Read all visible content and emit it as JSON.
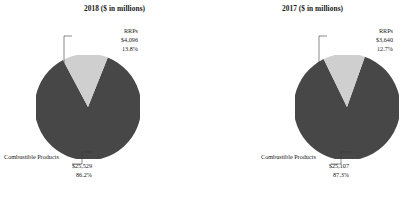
{
  "chart_data": [
    {
      "type": "pie",
      "title": "2018 ($ in millions)",
      "categories": [
        "RRPs",
        "Combustible Products"
      ],
      "values": [
        4096,
        25529
      ],
      "percentages": [
        13.8,
        87.3
      ],
      "labels": [
        {
          "name": "RRPs",
          "value": "$4,096",
          "percent": "13.8%"
        },
        {
          "name": "Combustible Products",
          "value": "$25,529",
          "percent": "86.2%"
        }
      ],
      "colors": [
        "#cfcfcf",
        "#474747"
      ],
      "legend": "none",
      "grid": false,
      "start_angle_deg": -28
    },
    {
      "type": "pie",
      "title": "2017 ($ in millions)",
      "categories": [
        "RRPs",
        "Combustible Products"
      ],
      "values": [
        3640,
        25107
      ],
      "percentages": [
        12.7,
        87.3
      ],
      "labels": [
        {
          "name": "RRPs",
          "value": "$3,640",
          "percent": "12.7%"
        },
        {
          "name": "Combustible Products",
          "value": "$25,107",
          "percent": "87.3%"
        }
      ],
      "colors": [
        "#cfcfcf",
        "#474747"
      ],
      "legend": "none",
      "grid": false,
      "start_angle_deg": -26
    }
  ],
  "left": {
    "title": "2018 ($ in millions)",
    "rrp": {
      "name": "RRPs",
      "value": "$4,096",
      "percent": "13.8%"
    },
    "combustible": {
      "name": "Combustible Products",
      "value": "$25,529",
      "percent": "86.2%"
    }
  },
  "right": {
    "title": "2017 ($ in millions)",
    "rrp": {
      "name": "RRPs",
      "value": "$3,640",
      "percent": "12.7%"
    },
    "combustible": {
      "name": "Combustible Products",
      "value": "$25,107",
      "percent": "87.3%"
    }
  },
  "colors": {
    "rrp_slice": "#cfcfcf",
    "combustible_slice": "#474747",
    "leader_line": "#3a3a3a",
    "text": "#1a1a1a",
    "background": "#ffffff"
  }
}
